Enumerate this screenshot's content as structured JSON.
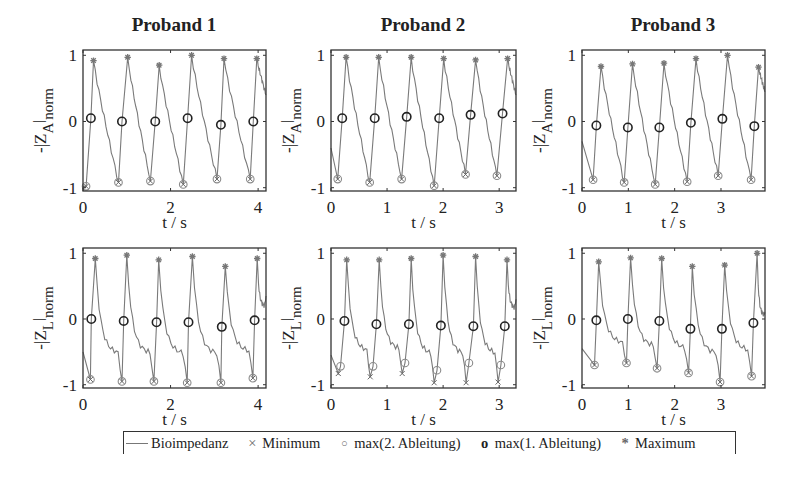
{
  "figure": {
    "legend": {
      "items": [
        {
          "label": "Bioimpedanz",
          "glyph": "line"
        },
        {
          "label": "Minimum",
          "glyph": "×"
        },
        {
          "label": "max(2. Ableitung)",
          "glyph": "○"
        },
        {
          "label": "max(1. Ableitung)",
          "glyph": "o"
        },
        {
          "label": "Maximum",
          "glyph": "*"
        }
      ]
    },
    "colors": {
      "signal": "#7a7a7a",
      "minimum": "#666666",
      "max2": "#8a8a8a",
      "max1": "#222222",
      "maximum": "#777777",
      "axes": "#333333"
    }
  },
  "chart_data": [
    {
      "type": "line",
      "title": "Proband 1",
      "column": 1,
      "row": 1,
      "ylabel": "-|Z_A|_norm",
      "ylabel_main": "-|Z",
      "ylabel_sub": "A",
      "ylabel_sub2": "norm",
      "xlabel": "t / s",
      "xlim": [
        0,
        4.18
      ],
      "ylim": [
        -1.05,
        1.08
      ],
      "xticks": [
        0,
        2,
        4
      ],
      "yticks": [
        -1,
        0,
        1
      ],
      "minimum": [
        [
          0.07,
          -0.98
        ],
        [
          0.81,
          -0.92
        ],
        [
          1.54,
          -0.9
        ],
        [
          2.29,
          -0.95
        ],
        [
          3.06,
          -0.87
        ],
        [
          3.82,
          -0.87
        ]
      ],
      "max2": [
        [
          0.07,
          -0.98
        ],
        [
          0.81,
          -0.92
        ],
        [
          1.54,
          -0.9
        ],
        [
          2.29,
          -0.95
        ],
        [
          3.06,
          -0.87
        ],
        [
          3.82,
          -0.87
        ]
      ],
      "max1": [
        [
          0.18,
          0.05
        ],
        [
          0.89,
          0.0
        ],
        [
          1.65,
          0.0
        ],
        [
          2.39,
          0.05
        ],
        [
          3.15,
          -0.05
        ],
        [
          3.89,
          0.0
        ]
      ],
      "maximum": [
        [
          0.24,
          0.92
        ],
        [
          1.02,
          0.97
        ],
        [
          1.74,
          0.85
        ],
        [
          2.48,
          1.0
        ],
        [
          3.22,
          0.95
        ],
        [
          3.97,
          0.95
        ]
      ],
      "end_value": 0.4,
      "start_value": -0.98
    },
    {
      "type": "line",
      "title": "Proband 2",
      "column": 2,
      "row": 1,
      "ylabel": "-|Z_A|_norm",
      "ylabel_main": "-|Z",
      "ylabel_sub": "A",
      "ylabel_sub2": "norm",
      "xlabel": "t / s",
      "xlim": [
        0,
        3.3
      ],
      "ylim": [
        -1.05,
        1.08
      ],
      "xticks": [
        0,
        1,
        2,
        3
      ],
      "yticks": [
        -1,
        0,
        1
      ],
      "minimum": [
        [
          0.12,
          -0.87
        ],
        [
          0.69,
          -0.92
        ],
        [
          1.26,
          -0.87
        ],
        [
          1.84,
          -0.97
        ],
        [
          2.4,
          -0.8
        ],
        [
          2.96,
          -0.82
        ]
      ],
      "max2": [
        [
          0.12,
          -0.87
        ],
        [
          0.69,
          -0.92
        ],
        [
          1.26,
          -0.87
        ],
        [
          1.84,
          -0.97
        ],
        [
          2.4,
          -0.8
        ],
        [
          2.96,
          -0.82
        ]
      ],
      "max1": [
        [
          0.2,
          0.05
        ],
        [
          0.78,
          0.05
        ],
        [
          1.35,
          0.07
        ],
        [
          1.93,
          0.05
        ],
        [
          2.49,
          0.1
        ],
        [
          3.06,
          0.12
        ]
      ],
      "maximum": [
        [
          0.27,
          0.97
        ],
        [
          0.85,
          0.97
        ],
        [
          1.43,
          0.97
        ],
        [
          2.01,
          0.95
        ],
        [
          2.58,
          0.93
        ],
        [
          3.15,
          0.95
        ]
      ],
      "end_value": 0.4,
      "start_value": -0.4
    },
    {
      "type": "line",
      "title": "Proband 3",
      "column": 3,
      "row": 1,
      "ylabel": "-|Z_A|_norm",
      "ylabel_main": "-|Z",
      "ylabel_sub": "A",
      "ylabel_sub2": "norm",
      "xlabel": "t / s",
      "xlim": [
        0,
        3.95
      ],
      "ylim": [
        -1.05,
        1.08
      ],
      "xticks": [
        0,
        1,
        2,
        3
      ],
      "yticks": [
        -1,
        0,
        1
      ],
      "minimum": [
        [
          0.24,
          -0.88
        ],
        [
          0.91,
          -0.92
        ],
        [
          1.58,
          -0.95
        ],
        [
          2.27,
          -0.91
        ],
        [
          2.94,
          -0.82
        ],
        [
          3.65,
          -0.88
        ]
      ],
      "max2": [
        [
          0.24,
          -0.88
        ],
        [
          0.91,
          -0.92
        ],
        [
          1.58,
          -0.95
        ],
        [
          2.27,
          -0.91
        ],
        [
          2.94,
          -0.82
        ],
        [
          3.65,
          -0.88
        ]
      ],
      "max1": [
        [
          0.31,
          -0.06
        ],
        [
          0.99,
          -0.09
        ],
        [
          1.67,
          -0.09
        ],
        [
          2.35,
          -0.02
        ],
        [
          3.03,
          0.04
        ],
        [
          3.72,
          -0.07
        ]
      ],
      "maximum": [
        [
          0.41,
          0.83
        ],
        [
          1.09,
          0.87
        ],
        [
          1.77,
          0.88
        ],
        [
          2.46,
          0.95
        ],
        [
          3.14,
          1.0
        ],
        [
          3.81,
          0.82
        ]
      ],
      "end_value": 0.45,
      "start_value": -0.3
    },
    {
      "type": "line",
      "title": "",
      "column": 1,
      "row": 2,
      "ylabel": "-|Z_L|_norm",
      "ylabel_main": "-|Z",
      "ylabel_sub": "L",
      "ylabel_sub2": "norm",
      "xlabel": "t / s",
      "xlim": [
        0,
        4.18
      ],
      "ylim": [
        -1.05,
        1.08
      ],
      "xticks": [
        0,
        2,
        4
      ],
      "yticks": [
        -1,
        0,
        1
      ],
      "minimum": [
        [
          0.17,
          -0.92
        ],
        [
          0.89,
          -0.95
        ],
        [
          1.62,
          -0.95
        ],
        [
          2.38,
          -0.97
        ],
        [
          3.15,
          -0.97
        ],
        [
          3.88,
          -0.9
        ]
      ],
      "max2": [
        [
          0.17,
          -0.92
        ],
        [
          0.89,
          -0.95
        ],
        [
          1.62,
          -0.95
        ],
        [
          2.38,
          -0.97
        ],
        [
          3.15,
          -0.97
        ],
        [
          3.88,
          -0.9
        ]
      ],
      "max1": [
        [
          0.19,
          0.0
        ],
        [
          0.93,
          -0.03
        ],
        [
          1.68,
          -0.05
        ],
        [
          2.41,
          -0.05
        ],
        [
          3.17,
          -0.12
        ],
        [
          3.92,
          -0.02
        ]
      ],
      "maximum": [
        [
          0.28,
          0.92
        ],
        [
          1.0,
          0.97
        ],
        [
          1.73,
          0.9
        ],
        [
          2.5,
          0.95
        ],
        [
          3.25,
          0.8
        ],
        [
          3.98,
          0.92
        ]
      ],
      "end_value": 0.35,
      "start_value": -0.5
    },
    {
      "type": "line",
      "title": "",
      "column": 2,
      "row": 2,
      "ylabel": "-|Z_L|_norm",
      "ylabel_main": "-|Z",
      "ylabel_sub": "L",
      "ylabel_sub2": "norm",
      "xlabel": "t / s",
      "xlim": [
        0,
        3.3
      ],
      "ylim": [
        -1.05,
        1.08
      ],
      "xticks": [
        0,
        1,
        2,
        3
      ],
      "yticks": [
        -1,
        0,
        1
      ],
      "minimum": [
        [
          0.13,
          -0.83
        ],
        [
          0.7,
          -0.88
        ],
        [
          1.27,
          -0.83
        ],
        [
          1.84,
          -0.97
        ],
        [
          2.41,
          -0.97
        ],
        [
          2.98,
          -0.96
        ]
      ],
      "max2": [
        [
          0.17,
          -0.72
        ],
        [
          0.75,
          -0.72
        ],
        [
          1.32,
          -0.67
        ],
        [
          1.89,
          -0.78
        ],
        [
          2.46,
          -0.67
        ],
        [
          3.03,
          -0.7
        ]
      ],
      "max1": [
        [
          0.24,
          -0.03
        ],
        [
          0.81,
          -0.08
        ],
        [
          1.39,
          -0.08
        ],
        [
          1.96,
          -0.1
        ],
        [
          2.54,
          -0.11
        ],
        [
          3.1,
          -0.11
        ]
      ],
      "maximum": [
        [
          0.28,
          0.9
        ],
        [
          0.86,
          0.9
        ],
        [
          1.43,
          0.92
        ],
        [
          2.0,
          0.97
        ],
        [
          2.58,
          0.95
        ],
        [
          3.14,
          0.9
        ]
      ],
      "end_value": 0.3,
      "start_value": -0.55
    },
    {
      "type": "line",
      "title": "",
      "column": 3,
      "row": 2,
      "ylabel": "-|Z_L|_norm",
      "ylabel_main": "-|Z",
      "ylabel_sub": "L",
      "ylabel_sub2": "norm",
      "xlabel": "t / s",
      "xlim": [
        0,
        3.95
      ],
      "ylim": [
        -1.05,
        1.08
      ],
      "xticks": [
        0,
        1,
        2,
        3
      ],
      "yticks": [
        -1,
        0,
        1
      ],
      "minimum": [
        [
          0.27,
          -0.7
        ],
        [
          0.96,
          -0.67
        ],
        [
          1.62,
          -0.75
        ],
        [
          2.3,
          -0.82
        ],
        [
          2.98,
          -0.96
        ],
        [
          3.66,
          -0.87
        ]
      ],
      "max2": [
        [
          0.27,
          -0.7
        ],
        [
          0.96,
          -0.67
        ],
        [
          1.62,
          -0.75
        ],
        [
          2.3,
          -0.82
        ],
        [
          2.98,
          -0.96
        ],
        [
          3.66,
          -0.87
        ]
      ],
      "max1": [
        [
          0.31,
          -0.02
        ],
        [
          0.99,
          0.0
        ],
        [
          1.67,
          -0.03
        ],
        [
          2.34,
          -0.15
        ],
        [
          3.02,
          -0.15
        ],
        [
          3.7,
          -0.06
        ]
      ],
      "maximum": [
        [
          0.36,
          0.87
        ],
        [
          1.05,
          0.93
        ],
        [
          1.72,
          0.92
        ],
        [
          2.38,
          0.8
        ],
        [
          3.08,
          0.82
        ],
        [
          3.78,
          1.0
        ]
      ],
      "end_value": 0.1,
      "start_value": -0.45
    }
  ]
}
